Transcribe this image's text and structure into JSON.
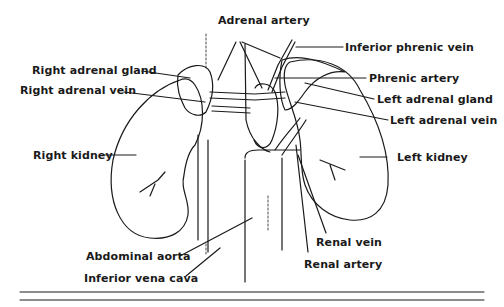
{
  "labels": {
    "adrenal_artery": "Adrenal artery",
    "inferior_phrenic_vein": "Inferior phrenic vein",
    "right_adrenal_gland": "Right adrenal gland",
    "phrenic_artery": "Phrenic artery",
    "right_adrenal_vein": "Right adrenal vein",
    "left_adrenal_gland": "Left adrenal gland",
    "left_adrenal_vein": "Left adrenal vein",
    "right_kidney": "Right kidney",
    "left_kidney": "Left kidney",
    "abdominal_aorta": "Abdominal aorta",
    "renal_vein": "Renal vein",
    "renal_artery": "Renal artery",
    "inferior_vena_cava": "Inferior vena cava"
  },
  "colors": {
    "ink": "#1a1a1a",
    "background": "#ffffff"
  }
}
